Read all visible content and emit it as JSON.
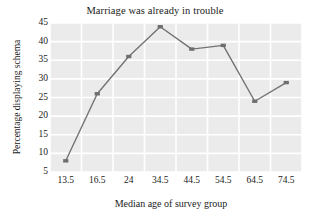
{
  "chart_data": {
    "type": "line",
    "title": "Marriage was already in trouble",
    "xlabel": "Median age of survey group",
    "ylabel": "Percentage displaying schema",
    "categories": [
      "13.5",
      "16.5",
      "24",
      "34.5",
      "44.5",
      "54.5",
      "64.5",
      "74.5"
    ],
    "values": [
      8,
      26,
      36,
      44,
      38,
      39,
      24,
      29
    ],
    "yticks": [
      45,
      40,
      35,
      30,
      25,
      20,
      15,
      10,
      5
    ],
    "ylim": [
      5,
      45
    ],
    "grid": true,
    "legend": null,
    "series": [
      {
        "name": "Percentage displaying schema",
        "values": [
          8,
          26,
          36,
          44,
          38,
          39,
          24,
          29
        ]
      }
    ],
    "colors": {
      "line": "#737373",
      "marker": "#6e6e6e",
      "plot_background": "#ebebeb",
      "gridline": "#ffffff",
      "text": "#1a1a1a",
      "figure_background": "#ffffff"
    },
    "marker_style": "square"
  }
}
